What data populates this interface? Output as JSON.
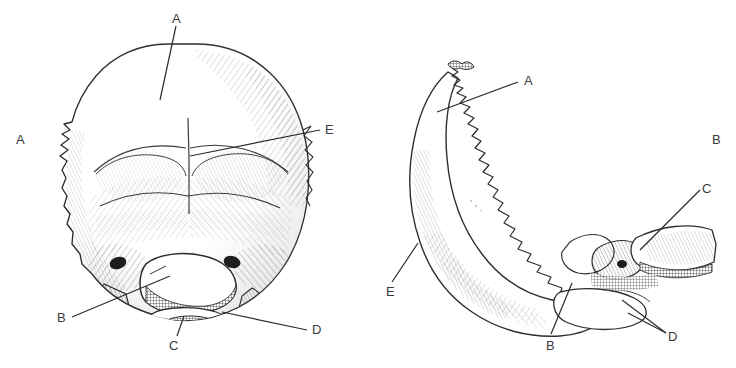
{
  "figure": {
    "background_color": "#ffffff",
    "ink_color": "#2e2e2e",
    "label_color": "#3b3b3b",
    "width": 736,
    "height": 368
  },
  "panels": [
    {
      "id": "left",
      "name": "posterior-view",
      "caption": "",
      "labels": [
        {
          "key": "A_top",
          "text": "A",
          "x": 172,
          "y": 12,
          "leader": true
        },
        {
          "key": "A_side",
          "text": "A",
          "x": 16,
          "y": 133,
          "leader": false
        },
        {
          "key": "E",
          "text": "E",
          "x": 325,
          "y": 123,
          "leader": true
        },
        {
          "key": "B",
          "text": "B",
          "x": 57,
          "y": 311,
          "leader": true
        },
        {
          "key": "C",
          "text": "C",
          "x": 169,
          "y": 339,
          "leader": true
        },
        {
          "key": "D",
          "text": "D",
          "x": 312,
          "y": 323,
          "leader": true
        }
      ]
    },
    {
      "id": "right",
      "name": "lateral-view",
      "caption": "",
      "labels": [
        {
          "key": "A",
          "text": "A",
          "x": 524,
          "y": 74,
          "leader": true
        },
        {
          "key": "B_side",
          "text": "B",
          "x": 712,
          "y": 133,
          "leader": false
        },
        {
          "key": "C",
          "text": "C",
          "x": 702,
          "y": 182,
          "leader": true
        },
        {
          "key": "E",
          "text": "E",
          "x": 386,
          "y": 285,
          "leader": true
        },
        {
          "key": "B",
          "text": "B",
          "x": 546,
          "y": 339,
          "leader": true
        },
        {
          "key": "D",
          "text": "D",
          "x": 668,
          "y": 330,
          "leader": true
        }
      ]
    }
  ],
  "legend_keys": [
    "A",
    "B",
    "C",
    "D",
    "E"
  ]
}
